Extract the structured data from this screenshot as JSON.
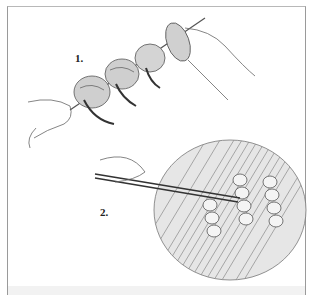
{
  "illustration": {
    "subject": "skewering and grilling shrimp",
    "steps": [
      {
        "number": "1.",
        "description": "threading shrimp onto a skewer"
      },
      {
        "number": "2.",
        "description": "turning skewers on a grill with tongs"
      }
    ]
  },
  "colors": {
    "ink": "#333333",
    "frame": "#9a9a9a",
    "strip": "#f2f2f2"
  }
}
